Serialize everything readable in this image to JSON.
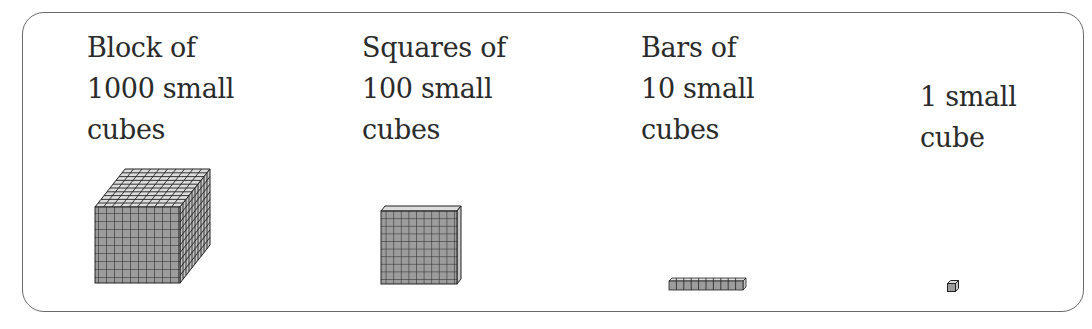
{
  "items": [
    {
      "lines": [
        "Block of",
        "1000 small",
        "cubes"
      ],
      "figure": "block-1000",
      "count": 1000
    },
    {
      "lines": [
        "Squares of",
        "100 small",
        "cubes"
      ],
      "figure": "flat-100",
      "count": 100
    },
    {
      "lines": [
        "Bars of",
        "10 small",
        "cubes"
      ],
      "figure": "rod-10",
      "count": 10
    },
    {
      "lines": [
        "1 small",
        "cube"
      ],
      "figure": "unit-1",
      "count": 1
    }
  ],
  "colors": {
    "face": "#9c9c9c",
    "top": "#dcdcdc",
    "side": "#c4c4c4",
    "grid": "#222222",
    "border": "#6a6a6a"
  }
}
